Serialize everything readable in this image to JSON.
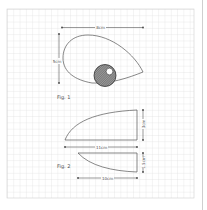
{
  "diagram": {
    "background": "graph-paper",
    "grid": {
      "x0": 7,
      "y0": 9,
      "x1": 194,
      "y1": 198,
      "cell": 6.3,
      "color": "#d9d9d9"
    },
    "figure1": {
      "label": "Fig. 1",
      "width_label": "8cm",
      "height_label": "5cm",
      "shape": "teardrop-with-hatched-circle"
    },
    "figure2": {
      "label": "Fig. 2",
      "upper": {
        "height_label": "3cm",
        "width_label": "11cm"
      },
      "lower": {
        "height_label": "1.5cm",
        "width_label": "10cm"
      }
    },
    "colors": {
      "line": "#555555",
      "hatch": "#7a7a7a",
      "grid": "#d9d9d9"
    }
  }
}
